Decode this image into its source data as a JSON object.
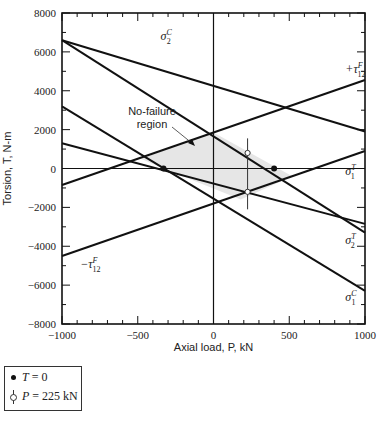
{
  "chart_data": {
    "type": "line",
    "title": "",
    "xlabel": "Axial load, P, kN",
    "ylabel": "Torsion, T, N·m",
    "xlim": [
      -1000,
      1000
    ],
    "ylim": [
      -8000,
      8000
    ],
    "x_ticks": [
      -1000,
      -500,
      0,
      500,
      1000
    ],
    "y_ticks": [
      8000,
      6000,
      4000,
      2000,
      0,
      -2000,
      -4000,
      -6000,
      -8000
    ],
    "grid": false,
    "series": [
      {
        "name": "σ2C (upper)",
        "x": [
          -1000,
          1000
        ],
        "y": [
          6600,
          1900
        ]
      },
      {
        "name": "σ1T / σ2C",
        "x": [
          -1000,
          1000
        ],
        "y": [
          6600,
          -3300
        ]
      },
      {
        "name": "σ1C",
        "x": [
          -1000,
          1000
        ],
        "y": [
          3200,
          -6300
        ]
      },
      {
        "name": "σ2T",
        "x": [
          -1000,
          1000
        ],
        "y": [
          1300,
          -2850
        ]
      },
      {
        "name": "+τ12F",
        "x": [
          -1000,
          1000
        ],
        "y": [
          -850,
          4550
        ]
      },
      {
        "name": "−τ12F",
        "x": [
          -1000,
          1000
        ],
        "y": [
          -4500,
          900
        ]
      }
    ],
    "points": {
      "T_equals_0": [
        [
          -330,
          0
        ],
        [
          400,
          0
        ]
      ],
      "P_equals_225": {
        "x": 225,
        "circles": [
          800,
          -1200
        ],
        "range": [
          1550,
          -2100
        ]
      }
    },
    "no_failure_region": [
      [
        -480,
        500
      ],
      [
        0,
        1850
      ],
      [
        520,
        -400
      ],
      [
        180,
        -1600
      ],
      [
        -330,
        0
      ]
    ],
    "annotations": [
      {
        "text": "σ",
        "sup": "C",
        "sub": "2",
        "x": -350,
        "y": 6600
      },
      {
        "text": "+τ",
        "sup": "F",
        "sub": "12",
        "x": 870,
        "y": 4900
      },
      {
        "text": "σ",
        "sup": "T",
        "sub": "1",
        "x": 870,
        "y": -350
      },
      {
        "text": "σ",
        "sup": "T",
        "sub": "2",
        "x": 870,
        "y": -3900
      },
      {
        "text": "σ",
        "sup": "C",
        "sub": "1",
        "x": 870,
        "y": -6800
      },
      {
        "text": "−τ",
        "sup": "F",
        "sub": "12",
        "x": -880,
        "y": -5100
      }
    ],
    "region_label": [
      "No-failure",
      "region"
    ],
    "legend": [
      {
        "marker": "filled-dot",
        "label": "T = 0"
      },
      {
        "marker": "open-circle-bar",
        "label": "P = 225 kN"
      }
    ]
  },
  "axes": {
    "xlabel": "Axial load, P, kN",
    "ylabel": "Torsion, T, N-m"
  },
  "legend": {
    "t0_var": "T",
    "t0_rest": " = 0",
    "p_var": "P",
    "p_rest": " = 225 kN"
  }
}
